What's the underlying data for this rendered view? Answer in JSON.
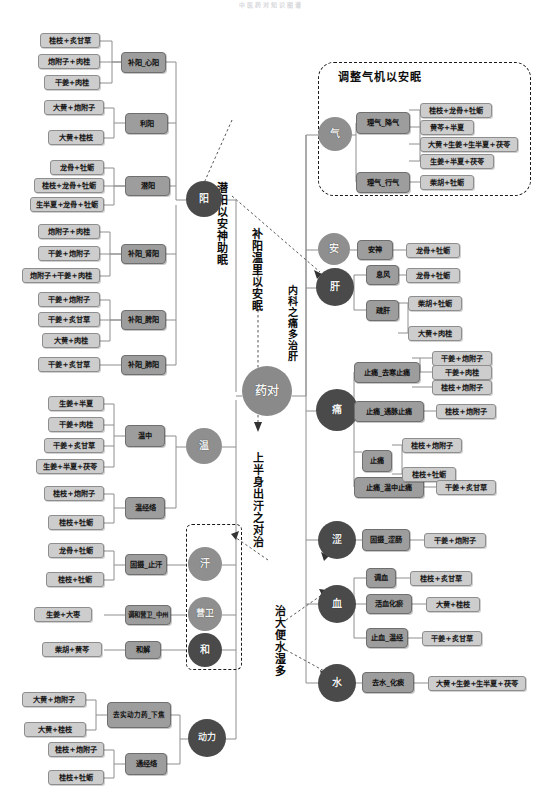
{
  "page_title": "中医药对知识图谱",
  "colors": {
    "leaf_fill": "#cdcdcd",
    "category_fill": "#9d9d9d",
    "circle_light": "#8f8f8f",
    "circle_dark": "#4a4a4a",
    "root_fill": "#8a8a8a",
    "line": "#8e8e8e",
    "text": "#111111"
  },
  "root": {
    "label": "药对"
  },
  "annotations": [
    {
      "name": "qian-yang-an-shen",
      "text": "潜阳以安神助眠"
    },
    {
      "name": "bu-yang-wen-li",
      "text": "补阳温里以安眠"
    },
    {
      "name": "shang-ban-shen-han",
      "text": "上半身出汗之对治"
    },
    {
      "name": "zhi-da-bian",
      "text": "治大便水湿多"
    },
    {
      "name": "nei-ke-zhi-tong",
      "text": "内科之痛多治肝"
    }
  ],
  "group_titles": [
    {
      "name": "qi-group-title",
      "text": "调整气机以安眠"
    }
  ],
  "hubs": [
    {
      "id": "yang",
      "label": "阳",
      "tone": "dark"
    },
    {
      "id": "wen",
      "label": "温",
      "tone": "light"
    },
    {
      "id": "han",
      "label": "汗",
      "tone": "light"
    },
    {
      "id": "yingwei",
      "label": "营卫",
      "tone": "light"
    },
    {
      "id": "he",
      "label": "和",
      "tone": "dark"
    },
    {
      "id": "dongli",
      "label": "动力",
      "tone": "dark"
    },
    {
      "id": "qi",
      "label": "气",
      "tone": "light"
    },
    {
      "id": "an",
      "label": "安",
      "tone": "light"
    },
    {
      "id": "gan",
      "label": "肝",
      "tone": "dark"
    },
    {
      "id": "tong",
      "label": "痛",
      "tone": "dark"
    },
    {
      "id": "se",
      "label": "涩",
      "tone": "dark"
    },
    {
      "id": "xue",
      "label": "血",
      "tone": "dark"
    },
    {
      "id": "shui",
      "label": "水",
      "tone": "dark"
    }
  ],
  "categories": [
    {
      "id": "c1",
      "label": "补阳_心阳",
      "hub": "yang"
    },
    {
      "id": "c2",
      "label": "利阳",
      "hub": "yang"
    },
    {
      "id": "c3",
      "label": "潜阳",
      "hub": "yang"
    },
    {
      "id": "c4",
      "label": "补阳_肾阳",
      "hub": "yang"
    },
    {
      "id": "c5",
      "label": "补阳_脾阳",
      "hub": "yang"
    },
    {
      "id": "c6",
      "label": "补阳_肺阳",
      "hub": "yang"
    },
    {
      "id": "c7",
      "label": "温中",
      "hub": "wen"
    },
    {
      "id": "c8",
      "label": "温经络",
      "hub": "wen"
    },
    {
      "id": "c9",
      "label": "固摄_止汗",
      "hub": "han"
    },
    {
      "id": "c10",
      "label": "调和营卫_中州",
      "hub": "yingwei"
    },
    {
      "id": "c11",
      "label": "和解",
      "hub": "he"
    },
    {
      "id": "c12",
      "label": "去实动力药_下焦",
      "hub": "dongli"
    },
    {
      "id": "c13",
      "label": "通经络",
      "hub": "dongli"
    },
    {
      "id": "c14",
      "label": "理气_降气",
      "hub": "qi"
    },
    {
      "id": "c15",
      "label": "理气_行气",
      "hub": "qi"
    },
    {
      "id": "c16",
      "label": "安神",
      "hub": "an"
    },
    {
      "id": "c17",
      "label": "息风",
      "hub": "gan"
    },
    {
      "id": "c18",
      "label": "疏肝",
      "hub": "gan"
    },
    {
      "id": "c19",
      "label": "止痛_去寒止痛",
      "hub": "tong"
    },
    {
      "id": "c20",
      "label": "止痛_通脉止痛",
      "hub": "tong"
    },
    {
      "id": "c21",
      "label": "止痛",
      "hub": "tong"
    },
    {
      "id": "c22",
      "label": "止痛_温中止痛",
      "hub": "tong"
    },
    {
      "id": "c23",
      "label": "固摄_涩肠",
      "hub": "se"
    },
    {
      "id": "c24",
      "label": "调血",
      "hub": "xue"
    },
    {
      "id": "c25",
      "label": "活血化瘀",
      "hub": "xue"
    },
    {
      "id": "c26",
      "label": "止血_温经",
      "hub": "xue"
    },
    {
      "id": "c27",
      "label": "去水_化痰",
      "hub": "shui"
    }
  ],
  "leaves": [
    {
      "id": "l1",
      "text": "桂枝+炙甘草",
      "cat": "c1"
    },
    {
      "id": "l2",
      "text": "炮附子+肉桂",
      "cat": "c1"
    },
    {
      "id": "l3",
      "text": "干姜+肉桂",
      "cat": "c1"
    },
    {
      "id": "l4",
      "text": "大黄+炮附子",
      "cat": "c2"
    },
    {
      "id": "l5",
      "text": "大黄+桂枝",
      "cat": "c2"
    },
    {
      "id": "l6",
      "text": "龙骨+牡蛎",
      "cat": "c3"
    },
    {
      "id": "l7",
      "text": "桂枝+龙骨+牡蛎",
      "cat": "c3"
    },
    {
      "id": "l8",
      "text": "生半夏+龙骨+牡蛎",
      "cat": "c3"
    },
    {
      "id": "l9",
      "text": "炮附子+肉桂",
      "cat": "c4"
    },
    {
      "id": "l10",
      "text": "干姜+炮附子",
      "cat": "c4"
    },
    {
      "id": "l11",
      "text": "炮附子+干姜+肉桂",
      "cat": "c4"
    },
    {
      "id": "l12",
      "text": "干姜+炮附子",
      "cat": "c5"
    },
    {
      "id": "l13",
      "text": "干姜+炙甘草",
      "cat": "c5"
    },
    {
      "id": "l14",
      "text": "大黄+肉桂",
      "cat": "c5"
    },
    {
      "id": "l15",
      "text": "干姜+炙甘草",
      "cat": "c6"
    },
    {
      "id": "l16",
      "text": "生姜+半夏",
      "cat": "c7"
    },
    {
      "id": "l17",
      "text": "干姜+肉桂",
      "cat": "c7"
    },
    {
      "id": "l18",
      "text": "干姜+炙甘草",
      "cat": "c7"
    },
    {
      "id": "l19",
      "text": "生姜+半夏+茯苓",
      "cat": "c7"
    },
    {
      "id": "l20",
      "text": "桂枝+炮附子",
      "cat": "c8"
    },
    {
      "id": "l21",
      "text": "桂枝+牡蛎",
      "cat": "c8"
    },
    {
      "id": "l22",
      "text": "龙骨+牡蛎",
      "cat": "c9"
    },
    {
      "id": "l23",
      "text": "桂枝+牡蛎",
      "cat": "c9"
    },
    {
      "id": "l24",
      "text": "生姜+大枣",
      "cat": "c10"
    },
    {
      "id": "l25",
      "text": "柴胡+黄芩",
      "cat": "c11"
    },
    {
      "id": "l26",
      "text": "大黄+炮附子",
      "cat": "c12"
    },
    {
      "id": "l27",
      "text": "大黄+桂枝",
      "cat": "c12"
    },
    {
      "id": "l28",
      "text": "桂枝+炮附子",
      "cat": "c13"
    },
    {
      "id": "l29",
      "text": "桂枝+牡蛎",
      "cat": "c13"
    },
    {
      "id": "l30",
      "text": "桂枝+龙骨+牡蛎",
      "cat": "c14"
    },
    {
      "id": "l31",
      "text": "黄芩+半夏",
      "cat": "c14"
    },
    {
      "id": "l32",
      "text": "大黄+生姜+生半夏+茯苓",
      "cat": "c14"
    },
    {
      "id": "l33",
      "text": "生姜+半夏+茯苓",
      "cat": "c14"
    },
    {
      "id": "l34",
      "text": "柴胡+牡蛎",
      "cat": "c15"
    },
    {
      "id": "l35",
      "text": "龙骨+牡蛎",
      "cat": "c16"
    },
    {
      "id": "l36",
      "text": "龙骨+牡蛎",
      "cat": "c17"
    },
    {
      "id": "l37",
      "text": "柴胡+牡蛎",
      "cat": "c18"
    },
    {
      "id": "l38",
      "text": "大黄+肉桂",
      "cat": "c18"
    },
    {
      "id": "l39",
      "text": "干姜+炮附子",
      "cat": "c19"
    },
    {
      "id": "l40",
      "text": "干姜+肉桂",
      "cat": "c19"
    },
    {
      "id": "l41",
      "text": "桂枝+炮附子",
      "cat": "c19"
    },
    {
      "id": "l42",
      "text": "桂枝+炮附子",
      "cat": "c20"
    },
    {
      "id": "l43",
      "text": "桂枝+炮附子",
      "cat": "c21"
    },
    {
      "id": "l44",
      "text": "桂枝+牡蛎",
      "cat": "c21"
    },
    {
      "id": "l45",
      "text": "干姜+炙甘草",
      "cat": "c22"
    },
    {
      "id": "l46",
      "text": "干姜+炮附子",
      "cat": "c23"
    },
    {
      "id": "l47",
      "text": "桂枝+炙甘草",
      "cat": "c24"
    },
    {
      "id": "l48",
      "text": "大黄+桂枝",
      "cat": "c25"
    },
    {
      "id": "l49",
      "text": "干姜+炙甘草",
      "cat": "c26"
    },
    {
      "id": "l50",
      "text": "大黄+生姜+生半夏+茯苓",
      "cat": "c27"
    }
  ]
}
